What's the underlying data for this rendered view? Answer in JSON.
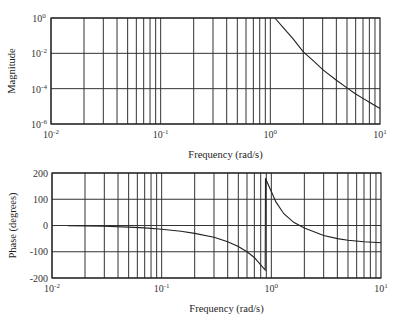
{
  "chart_data": [
    {
      "type": "line",
      "title": "",
      "xlabel": "Frequency (rad/s)",
      "ylabel": "Magnitude",
      "xscale": "log",
      "yscale": "log",
      "xlim": [
        0.01,
        10
      ],
      "ylim": [
        1e-06,
        1
      ],
      "grid": true,
      "x_ticks": [
        {
          "base": "10",
          "exp": "-2"
        },
        {
          "base": "10",
          "exp": "-1"
        },
        {
          "base": "10",
          "exp": "0"
        },
        {
          "base": "10",
          "exp": "1"
        }
      ],
      "y_ticks": [
        {
          "base": "10",
          "exp": "0"
        },
        {
          "base": "10",
          "exp": "-2"
        },
        {
          "base": "10",
          "exp": "-4"
        },
        {
          "base": "10",
          "exp": "-6"
        }
      ],
      "series": [
        {
          "name": "magnitude",
          "x": [
            1.1,
            1.3,
            1.6,
            2.0,
            2.5,
            3.0,
            4.0,
            5.0,
            6.0,
            7.0,
            8.0,
            10.0
          ],
          "y": [
            1.0,
            0.3,
            0.07,
            0.012,
            0.0035,
            0.0012,
            0.0003,
            0.00011,
            5e-05,
            2.8e-05,
            1.7e-05,
            7.5e-06
          ]
        }
      ]
    },
    {
      "type": "line",
      "title": "",
      "xlabel": "Frequency (rad/s)",
      "ylabel": "Phase (degrees)",
      "xscale": "log",
      "yscale": "linear",
      "xlim": [
        0.01,
        10
      ],
      "ylim": [
        -200,
        200
      ],
      "grid": true,
      "x_ticks": [
        {
          "base": "10",
          "exp": "-2"
        },
        {
          "base": "10",
          "exp": "-1"
        },
        {
          "base": "10",
          "exp": "0"
        },
        {
          "base": "10",
          "exp": "1"
        }
      ],
      "y_ticks": [
        "200",
        "100",
        "0",
        "-100",
        "-200"
      ],
      "series": [
        {
          "name": "phase",
          "x": [
            0.014,
            0.02,
            0.03,
            0.05,
            0.07,
            0.1,
            0.15,
            0.2,
            0.3,
            0.4,
            0.5,
            0.6,
            0.7,
            0.8,
            0.88,
            0.885,
            0.9,
            1.0,
            1.1,
            1.3,
            1.6,
            2.0,
            3.0,
            4.0,
            5.0,
            7.0,
            10.0
          ],
          "y": [
            -1,
            -2,
            -3,
            -6,
            -9,
            -14,
            -22,
            -30,
            -45,
            -62,
            -80,
            -100,
            -122,
            -150,
            -170,
            180,
            172,
            130,
            90,
            45,
            12,
            -10,
            -38,
            -50,
            -56,
            -62,
            -66
          ]
        }
      ]
    }
  ],
  "magnitude_plot": {
    "ylabel": "Magnitude",
    "xlabel": "Frequency (rad/s)"
  },
  "phase_plot": {
    "ylabel": "Phase (degrees)",
    "xlabel": "Frequency (rad/s)"
  }
}
